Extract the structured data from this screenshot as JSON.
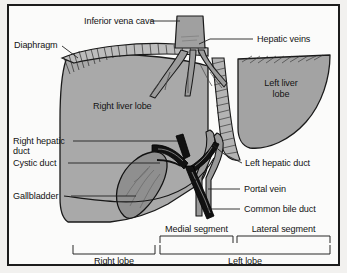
{
  "figure": {
    "type": "anatomical-illustration",
    "colors": {
      "background": "#fbfbfa",
      "frame_border": "#1c1c1c",
      "liver_fill": "#a9a9a9",
      "left_lobe_fill": "#a3a3a3",
      "gallbladder_fill": "#8f8f8f",
      "vessel_gray": "#9a9a9a",
      "duct_black": "#101010",
      "label_text": "#131313",
      "leader_line": "#2a2a2a"
    }
  },
  "labels": {
    "inferior_vena_cava": "Inferior vena cava",
    "hepatic_veins": "Hepatic veins",
    "diaphragm": "Diaphragm",
    "right_liver_lobe": "Right liver lobe",
    "left_liver_lobe_line1": "Left liver",
    "left_liver_lobe_line2": "lobe",
    "right_hepatic_duct_line1": "Right hepatic",
    "right_hepatic_duct_line2": "duct",
    "cystic_duct": "Cystic duct",
    "gallbladder": "Gallbladder",
    "left_hepatic_duct": "Left hepatic duct",
    "portal_vein": "Portal vein",
    "common_bile_duct": "Common bile duct"
  },
  "brackets": {
    "medial_segment": "Medial segment",
    "lateral_segment": "Lateral segment",
    "right_lobe": "Right lobe",
    "left_lobe": "Left lobe"
  }
}
